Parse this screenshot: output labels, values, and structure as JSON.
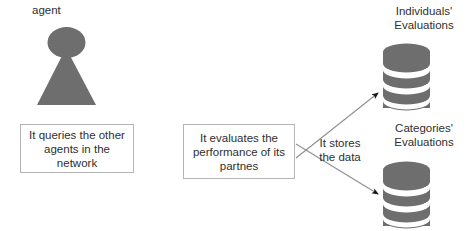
{
  "diagram": {
    "colors": {
      "shape_fill": "#6e6e6e",
      "shape_fill_dark": "#666666",
      "box_border": "#b4b4b4",
      "text": "#2f2f2f",
      "arrow": "#8a8a8a",
      "arrow_head": "#1a1a1a",
      "background": "#ffffff"
    },
    "actor": {
      "name": "agent",
      "label": "agent",
      "icon": "agent-figure-icon"
    },
    "processes": [
      {
        "id": "query",
        "label": "It queries the other agents in the network"
      },
      {
        "id": "evaluate",
        "label": "It evaluates the performance of its partnes"
      }
    ],
    "edges": [
      {
        "id": "stores-upper",
        "label": "It stores the data",
        "from": "evaluate",
        "to": "individuals-db"
      },
      {
        "id": "stores-lower",
        "label": "",
        "from": "evaluate",
        "to": "categories-db"
      }
    ],
    "edge_label": "It stores\nthe data",
    "datastores": [
      {
        "id": "individuals-db",
        "label": "Individuals'\nEvaluations",
        "icon": "database-cylinder-icon"
      },
      {
        "id": "categories-db",
        "label": "Categories'\nEvaluations",
        "icon": "database-cylinder-icon"
      }
    ]
  }
}
